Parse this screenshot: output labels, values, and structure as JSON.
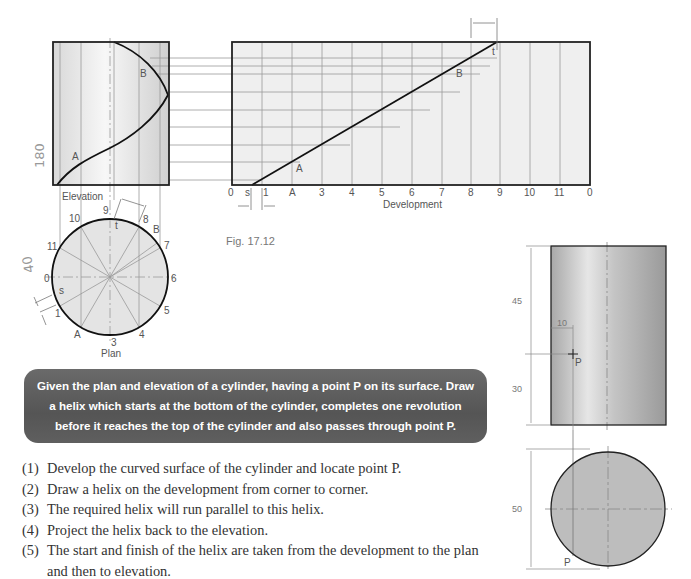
{
  "figure": {
    "caption": "Fig. 17.12",
    "elevation_label": "Elevation",
    "plan_label": "Plan",
    "development_label": "Development",
    "elevation_points": {
      "a": "A",
      "b": "B"
    },
    "development_ticks": [
      "0",
      "s",
      "1",
      "A",
      "3",
      "4",
      "5",
      "6",
      "7",
      "8",
      "9",
      "10",
      "11",
      "0"
    ],
    "development_points": {
      "a": "A",
      "b": "B",
      "t": "t"
    },
    "plan_numbers": [
      "0",
      "1",
      "A",
      "3",
      "4",
      "5",
      "6",
      "7",
      "B",
      "8",
      "9",
      "10",
      "11"
    ],
    "plan_points": {
      "s": "s",
      "t": "t"
    },
    "handwritten_elevation": "180",
    "handwritten_plan": "40"
  },
  "problem": {
    "text": "Given the plan and elevation of a cylinder, having a point P on its surface. Draw a helix which starts at the bottom of the cylinder, completes one revolution before it reaches the top of the cylinder and also passes through point P."
  },
  "steps": [
    {
      "num": "(1)",
      "text": "Develop the curved surface of the cylinder and locate point P."
    },
    {
      "num": "(2)",
      "text": "Draw a helix on the development from corner to corner."
    },
    {
      "num": "(3)",
      "text": "The required helix will run parallel to this helix."
    },
    {
      "num": "(4)",
      "text": "Project the helix back to the elevation."
    },
    {
      "num": "(5)",
      "text": "The start and finish of the helix are taken from the development to the plan and then to elevation."
    }
  ],
  "given": {
    "dim_height_top": "45",
    "dim_height_bottom": "30",
    "dim_offset": "10",
    "dim_diameter": "50",
    "point_label": "P",
    "plan_point_label": "P"
  }
}
